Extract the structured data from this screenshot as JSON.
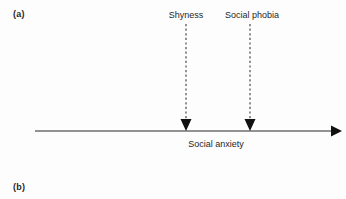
{
  "figure": {
    "panels": [
      {
        "id": "a",
        "label": "(a)"
      },
      {
        "id": "b",
        "label": "(b)"
      }
    ]
  },
  "diagram": {
    "type": "annotated-continuum-axis",
    "axis": {
      "caption": "Social anxiety",
      "orientation": "horizontal",
      "arrow_direction": "right",
      "start_x": 35,
      "end_x": 340,
      "y": 131,
      "color": "#6e6e6e",
      "stroke_width": 1.6
    },
    "markers": [
      {
        "label": "Shyness",
        "x": 186,
        "label_y": 10,
        "line_top_y": 24,
        "line_bottom_y": 131,
        "style": "dashed",
        "arrow_direction": "down",
        "color": "#3a3a3a"
      },
      {
        "label": "Social phobia",
        "x": 252,
        "label_y": 10,
        "line_top_y": 24,
        "line_bottom_y": 131,
        "style": "dashed",
        "arrow_direction": "down",
        "color": "#3a3a3a"
      }
    ],
    "colors": {
      "background": "#fdfdfd",
      "text": "#1f1f1f",
      "panel_label": "#2a2a2a",
      "axis_line": "#6e6e6e",
      "marker_line": "#3a3a3a",
      "arrow_fill": "#111111"
    }
  }
}
